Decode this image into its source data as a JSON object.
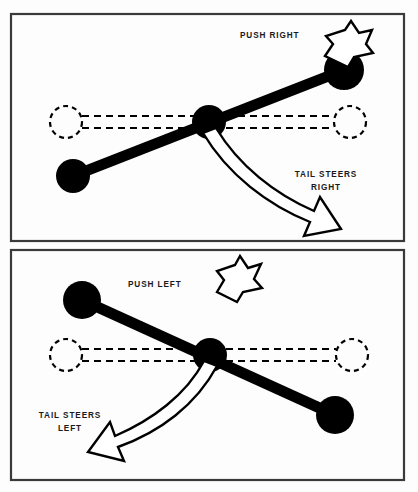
{
  "figure": {
    "background_color": "#fdfdfd",
    "ink_color": "#000000",
    "border_color": "#3a3a3a",
    "width": 418,
    "height": 492
  },
  "panels": [
    {
      "id": "panel-top",
      "name": "push-right-panel",
      "labels": {
        "push": "PUSH RIGHT",
        "tail_line1": "TAIL STEERS",
        "tail_line2": "RIGHT"
      }
    },
    {
      "id": "panel-bottom",
      "name": "push-left-panel",
      "labels": {
        "push": "PUSH LEFT",
        "tail_line1": "TAIL STEERS",
        "tail_line2": "LEFT"
      }
    }
  ],
  "icons": {
    "push_arrow": "straight-arrow-icon",
    "tail_arrow": "curved-arrow-icon",
    "pivot": "pivot-ball-icon",
    "ghost": "dashed-ghost-circle-icon"
  }
}
